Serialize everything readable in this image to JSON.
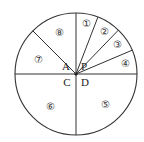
{
  "diagram": {
    "type": "circle-divided-into-sectors",
    "center": {
      "x": 76,
      "y": 74
    },
    "radius": 61,
    "stroke_color": "#333333",
    "background": "#ffffff",
    "spokes_deg": [
      90,
      69,
      46,
      23,
      0,
      270,
      180,
      135
    ],
    "center_points": [
      {
        "id": "A",
        "label": "A",
        "x": 66,
        "y": 70
      },
      {
        "id": "P",
        "label": "P",
        "x": 84,
        "y": 70
      },
      {
        "id": "C",
        "label": "C",
        "x": 67,
        "y": 86
      },
      {
        "id": "D",
        "label": "D",
        "x": 85,
        "y": 86
      }
    ],
    "sectors": [
      {
        "id": 1,
        "label": "①",
        "x": 86,
        "y": 27
      },
      {
        "id": 2,
        "label": "②",
        "x": 104,
        "y": 35
      },
      {
        "id": 3,
        "label": "③",
        "x": 117,
        "y": 48
      },
      {
        "id": 4,
        "label": "④",
        "x": 125,
        "y": 67
      },
      {
        "id": 5,
        "label": "⑤",
        "x": 105,
        "y": 108
      },
      {
        "id": 6,
        "label": "⑥",
        "x": 50,
        "y": 110
      },
      {
        "id": 7,
        "label": "⑦",
        "x": 38,
        "y": 63
      },
      {
        "id": 8,
        "label": "⑧",
        "x": 59,
        "y": 36
      }
    ]
  }
}
